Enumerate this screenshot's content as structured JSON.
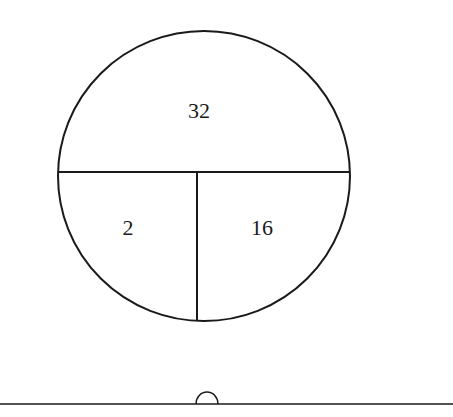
{
  "diagram": {
    "type": "partitioned-circle",
    "regions": [
      {
        "id": "top",
        "label": "32"
      },
      {
        "id": "bottom-left",
        "label": "2"
      },
      {
        "id": "bottom-right",
        "label": "16"
      }
    ],
    "stroke_color": "#1a1a1a",
    "background": "#ffffff"
  }
}
